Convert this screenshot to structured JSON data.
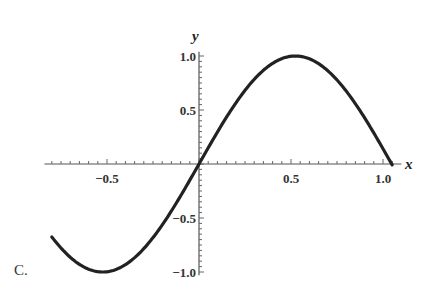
{
  "caption": "C.",
  "chart_data": {
    "type": "line",
    "title": "",
    "function": "y = sin(3x)",
    "xlabel": "x",
    "ylabel": "y",
    "xlim": [
      -0.8,
      1.05
    ],
    "ylim": [
      -1.0,
      1.0
    ],
    "grid": false,
    "legend": null,
    "x_ticks": [
      -0.5,
      0.5,
      1.0
    ],
    "x_tick_labels": [
      "-0.5",
      "0.5",
      "1.0"
    ],
    "y_ticks": [
      -1.0,
      -0.5,
      0.5,
      1.0
    ],
    "y_tick_labels": [
      "-1.0",
      "-0.5",
      "0.5",
      "1.0"
    ],
    "series": [
      {
        "name": "sin(3x)",
        "color": "#222222",
        "x": [
          -0.8,
          -0.7,
          -0.6,
          -0.5236,
          -0.4,
          -0.3,
          -0.2,
          -0.1,
          0.0,
          0.1,
          0.2,
          0.3,
          0.4,
          0.5236,
          0.6,
          0.7,
          0.8,
          0.9,
          1.0,
          1.0472
        ],
        "values": [
          -0.675,
          -0.863,
          -0.974,
          -1.0,
          -0.932,
          -0.783,
          -0.565,
          -0.296,
          0.0,
          0.296,
          0.565,
          0.783,
          0.932,
          1.0,
          0.974,
          0.863,
          0.675,
          0.427,
          0.141,
          0.0
        ]
      }
    ]
  }
}
